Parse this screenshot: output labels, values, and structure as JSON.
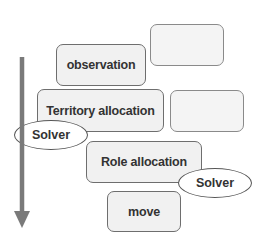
{
  "diagram": {
    "boxes": [
      {
        "label": "observation"
      },
      {
        "label": ""
      },
      {
        "label": "Territory allocation"
      },
      {
        "label": ""
      },
      {
        "label": "Role allocation"
      },
      {
        "label": "move"
      }
    ],
    "solvers": [
      {
        "label": "Solver"
      },
      {
        "label": "Solver"
      }
    ],
    "arrow": {
      "direction": "down",
      "color": "#7a7a7a"
    }
  }
}
